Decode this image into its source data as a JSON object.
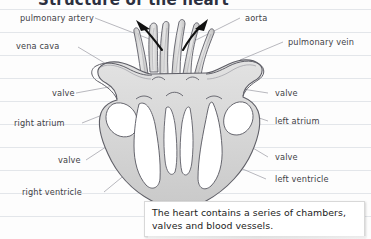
{
  "page": {
    "width": 371,
    "height": 239,
    "background": "#fdfdfd",
    "rule_color": "#e3e6ea",
    "title": "Structure of the heart"
  },
  "diagram": {
    "name": "human-heart-cross-section",
    "outline_color": "#5e5e66",
    "fill_color": "#d9d9d9",
    "chamber_fill": "#ffffff",
    "arrows": [
      {
        "name": "blood-flow-arrow-left",
        "direction": "up-left"
      },
      {
        "name": "blood-flow-arrow-right",
        "direction": "up-right"
      }
    ]
  },
  "labels": {
    "pulmonary_artery": "pulmonary artery",
    "aorta": "aorta",
    "vena_cava": "vena cava",
    "pulmonary_vein": "pulmonary vein",
    "valve_upper_left": "valve",
    "valve_upper_right": "valve",
    "right_atrium": "right atrium",
    "left_atrium": "left atrium",
    "valve_lower_left": "valve",
    "valve_lower_right": "valve",
    "right_ventricle": "right ventricle",
    "left_ventricle": "left ventricle"
  },
  "caption": {
    "text": "The heart contains a series of chambers, valves and blood vessels."
  }
}
